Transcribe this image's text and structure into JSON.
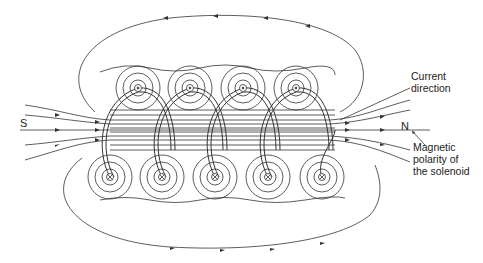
{
  "poles": {
    "south": "S",
    "north": "N"
  },
  "labels": {
    "current_line1": "Current",
    "current_line2": "direction",
    "polarity_line1": "Magnetic",
    "polarity_line2": "polarity of",
    "polarity_line3": "the solenoid"
  },
  "conductors": {
    "top_out_centers_x": [
      138,
      190,
      243,
      296
    ],
    "top_y": 88,
    "bottom_in_centers_x": [
      110,
      162,
      215,
      268,
      322
    ],
    "bottom_y": 177
  },
  "colors": {
    "line": "#333333",
    "background": "#ffffff"
  }
}
